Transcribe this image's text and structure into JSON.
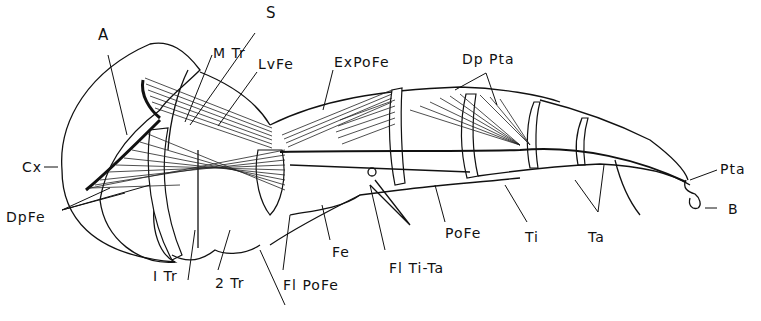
{
  "figure": {
    "labels": {
      "A": "A",
      "S": "S",
      "MTr": "M Tr",
      "LvFe": "LvFe",
      "ExPoFe": "ExPoFe",
      "DpPta": "Dp Pta",
      "Pta": "Pta",
      "B": "B",
      "Cx": "Cx",
      "DpFe": "DpFe",
      "Tr1": "I Tr",
      "Tr2": "2 Tr",
      "FlPoFe": "Fl PoFe",
      "Fe": "Fe",
      "FlTiTa": "Fl Ti-Ta",
      "PoFe": "PoFe",
      "Ti": "Ti",
      "Ta": "Ta"
    },
    "colors": {
      "ink": "#111111",
      "background": "#ffffff"
    }
  }
}
